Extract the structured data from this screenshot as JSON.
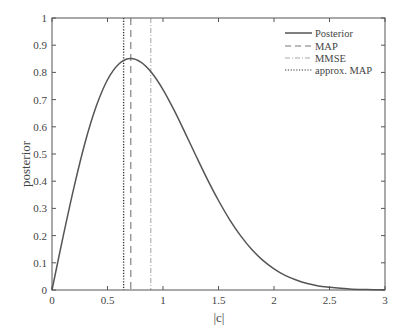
{
  "chart_data": {
    "type": "line",
    "title": "",
    "xlabel": "|c|",
    "ylabel": "posterior",
    "xlim": [
      0,
      3
    ],
    "ylim": [
      0,
      1
    ],
    "xticks": [
      0,
      0.5,
      1,
      1.5,
      2,
      2.5,
      3
    ],
    "xtick_labels": [
      "0",
      "0.5",
      "1",
      "1.5",
      "2",
      "2.5",
      "3"
    ],
    "yticks": [
      0,
      0.1,
      0.2,
      0.3,
      0.4,
      0.5,
      0.6,
      0.7,
      0.8,
      0.9,
      1
    ],
    "ytick_labels": [
      "0",
      "0.1",
      "0.2",
      "0.3",
      "0.4",
      "0.5",
      "0.6",
      "0.7",
      "0.8",
      "0.9",
      "1"
    ],
    "grid": false,
    "legend_position": "upper right",
    "series": [
      {
        "name": "Posterior",
        "style": "solid",
        "color": "#555555",
        "x": [
          0,
          0.1,
          0.2,
          0.3,
          0.4,
          0.5,
          0.6,
          0.7,
          0.8,
          0.9,
          1.0,
          1.1,
          1.2,
          1.3,
          1.4,
          1.5,
          1.6,
          1.7,
          1.8,
          1.9,
          2.0,
          2.1,
          2.2,
          2.3,
          2.4,
          2.5,
          2.6,
          2.7,
          2.8,
          2.9,
          3.0
        ],
        "y": [
          0,
          0.196,
          0.381,
          0.545,
          0.677,
          0.773,
          0.83,
          0.851,
          0.838,
          0.798,
          0.737,
          0.661,
          0.577,
          0.491,
          0.407,
          0.329,
          0.259,
          0.199,
          0.149,
          0.109,
          0.078,
          0.054,
          0.037,
          0.024,
          0.015,
          0.01,
          0.006,
          0.003,
          0.002,
          0.001,
          0.0005
        ]
      },
      {
        "name": "MAP",
        "style": "dashed",
        "color": "#777777",
        "vline_x": 0.71
      },
      {
        "name": "MMSE",
        "style": "dashdot",
        "color": "#aaaaaa",
        "vline_x": 0.89
      },
      {
        "name": "approx. MAP",
        "style": "dotted",
        "color": "#333333",
        "vline_x": 0.645
      }
    ]
  },
  "legend": {
    "items": [
      {
        "label": "Posterior"
      },
      {
        "label": "MAP"
      },
      {
        "label": "MMSE"
      },
      {
        "label": "approx. MAP"
      }
    ]
  }
}
